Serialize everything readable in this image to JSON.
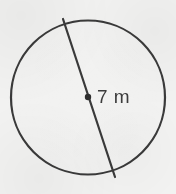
{
  "figure": {
    "kind": "geometry-diagram",
    "background_color": "#f2f2f1",
    "stroke_color": "#3a3a3a",
    "text_color": "#3c3c3c",
    "canvas": {
      "width": 176,
      "height": 194
    }
  },
  "circle": {
    "name": "circle-outline",
    "center_x": 88,
    "center_y": 97.5,
    "radius": 77,
    "stroke_width": 2.2,
    "fill": "none"
  },
  "diameter": {
    "name": "diameter-segment",
    "x1": 63,
    "y1": 19,
    "x2": 115,
    "y2": 177,
    "stroke_width": 2.2
  },
  "center_point": {
    "name": "center-dot",
    "x": 88,
    "y": 97,
    "radius": 3.2
  },
  "label": {
    "text": "7 m",
    "value": "7",
    "unit": "m",
    "x": 97,
    "y": 86,
    "font_size": 19
  }
}
